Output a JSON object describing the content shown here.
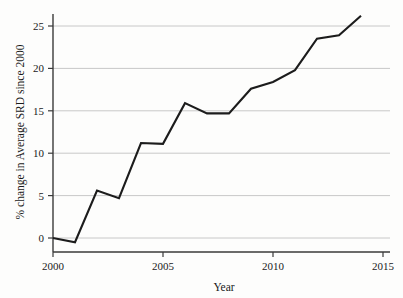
{
  "chart_data": {
    "type": "line",
    "title": "",
    "subtitle": "",
    "xlabel": "Year",
    "ylabel": "% change in Average SRD since 2000",
    "x": [
      2000,
      2001,
      2002,
      2003,
      2004,
      2005,
      2006,
      2007,
      2008,
      2009,
      2010,
      2011,
      2012,
      2013,
      2014
    ],
    "values": [
      0.0,
      -0.5,
      5.6,
      4.7,
      11.2,
      11.1,
      15.9,
      14.7,
      14.7,
      17.6,
      18.4,
      19.8,
      23.5,
      23.9,
      26.2
    ],
    "series": [
      {
        "name": "% change in Average SRD since 2000",
        "values": [
          0.0,
          -0.5,
          5.6,
          4.7,
          11.2,
          11.1,
          15.9,
          14.7,
          14.7,
          17.6,
          18.4,
          19.8,
          23.5,
          23.9,
          26.2
        ]
      }
    ],
    "xlim": [
      2000,
      2015
    ],
    "ylim": [
      -2.2,
      27.2
    ],
    "xticks": [
      2000,
      2005,
      2010,
      2015
    ],
    "xtick_labels": [
      "2000",
      "2005",
      "2010",
      "2015"
    ],
    "yticks": [
      0,
      5,
      10,
      15,
      20,
      25
    ],
    "ytick_labels": [
      "0",
      "5",
      "10",
      "15",
      "20",
      "25"
    ],
    "grid": "horizontal",
    "legend": "none",
    "annotations": []
  },
  "colors": {
    "background": "#fdfdfc",
    "plot_background": "#fdfdfc",
    "gridline": "#c8c8c8",
    "axis_spine": "#3a3a3a",
    "line": "#1c1c1c",
    "tick_label": "#1a1a1a"
  },
  "axis": {
    "x_title": "Year",
    "y_title": "% change in Average SRD since 2000",
    "x_ticks": [
      {
        "label": "2000"
      },
      {
        "label": "2005"
      },
      {
        "label": "2010"
      },
      {
        "label": "2015"
      }
    ],
    "y_ticks": [
      {
        "label": "25"
      },
      {
        "label": "20"
      },
      {
        "label": "15"
      },
      {
        "label": "10"
      },
      {
        "label": "5"
      },
      {
        "label": "0"
      }
    ]
  }
}
